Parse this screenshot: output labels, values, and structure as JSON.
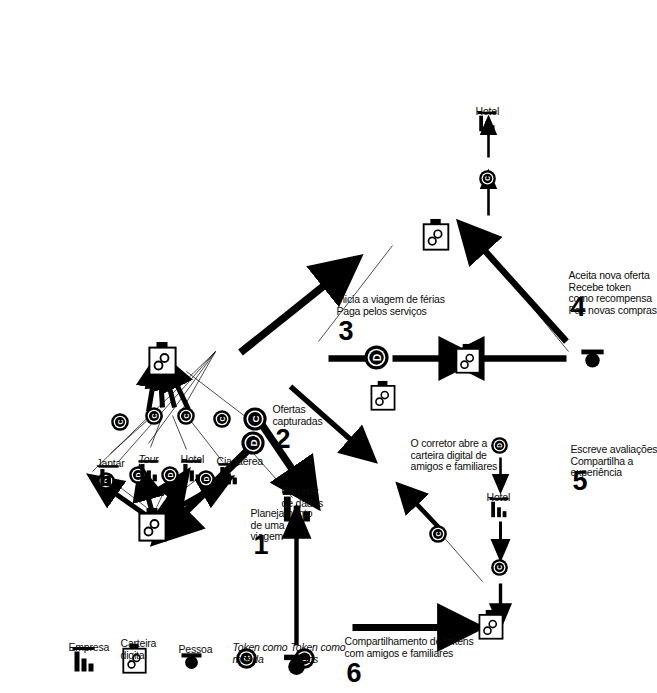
{
  "diagram": {
    "orientation": "rotated-90-ccw",
    "colors": {
      "ink": "#000000",
      "background": "#ffffff"
    },
    "legend": {
      "items": [
        {
          "icon": "company-bars-icon",
          "label": "Empresa"
        },
        {
          "icon": "digital-wallet-icon",
          "label": "Carteira\ndigital"
        },
        {
          "icon": "person-icon",
          "label": "Pessoa"
        },
        {
          "icon": "token-coin-icon",
          "label": "Token como\nmoeda",
          "glyph": "C",
          "italic_first_word": true
        },
        {
          "icon": "token-data-icon",
          "label": "Token como\ndados",
          "glyph": "D",
          "italic_first_word": true
        }
      ]
    },
    "hub": {
      "icon": "company-bars-icon",
      "label": "Corretor\nde dados"
    },
    "providers": [
      {
        "icon": "company-bars-icon",
        "label": "Cia. aérea"
      },
      {
        "icon": "company-bars-icon",
        "label": "Hotel"
      },
      {
        "icon": "company-bars-icon",
        "label": "Tour",
        "italic": true
      },
      {
        "icon": "company-bars-icon",
        "label": "Jantar"
      }
    ],
    "steps": [
      {
        "number": "1",
        "text": "Planejamento\nde uma\nviagem"
      },
      {
        "number": "2",
        "text": "Ofertas\ncapturadas"
      },
      {
        "number": "3",
        "text": "Inicia a viagem de férias\nPaga pelos serviços"
      },
      {
        "number": "4",
        "text": "Aceita nova oferta\nRecebe token\ncomo recompensa\nFaz novas compras",
        "italic_word": "token"
      },
      {
        "number": "5",
        "text": "Escreve avaliações\nCompartilha a\nexperiência"
      },
      {
        "number": "6",
        "text": "Compartilhamento de tokens\ncom amigos e familiares",
        "italic_word": "tokens"
      }
    ],
    "annotations": [
      {
        "name": "broker-opens-wallet-note",
        "text": "O corretor abre a\ncarteira digital de\namigos e familiares"
      }
    ],
    "small_labels": [
      {
        "name": "hotel-label-bottom-right",
        "text": "Hotel"
      },
      {
        "name": "hotel-label-bottom-left",
        "text": "Hotel"
      }
    ]
  }
}
